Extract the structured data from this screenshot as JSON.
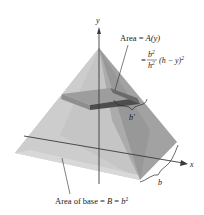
{
  "figure": {
    "type": "pyramid-cross-section",
    "axes": {
      "y_label": "y",
      "x_label": "x"
    },
    "labels": {
      "area_slice_line1_prefix": "Area = ",
      "area_slice_func": "A",
      "area_slice_arg": "(y)",
      "area_formula_eq": "=",
      "area_formula_num_base": "b",
      "area_formula_num_exp": "2",
      "area_formula_den_base": "h",
      "area_formula_den_exp": "2",
      "area_formula_tail": "(h − y)",
      "area_formula_tail_exp": "2",
      "slice_side": "b'",
      "base_side": "b",
      "base_area_prefix": "Area of base = ",
      "base_area_B": "B",
      "base_area_eq": " = ",
      "base_area_b": "b",
      "base_area_exp": "2"
    },
    "colors": {
      "left_face": "#b9b9b9",
      "front_face": "#cfcfcf",
      "right_face": "#9a9a9a",
      "slab_dark": "#4a4a4a",
      "slab_top": "#8a8a8a",
      "axis": "#3a3a3a",
      "text": "#1a1a1a"
    }
  }
}
